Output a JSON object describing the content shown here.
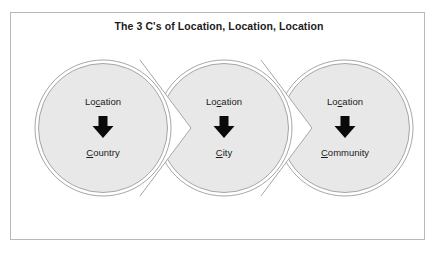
{
  "frame": {
    "border_color": "#b9b9b9",
    "background": "#ffffff"
  },
  "title": "The 3 C's of Location, Location, Location",
  "diagram": {
    "type": "chevron-process",
    "fill_color": "#e8e8e8",
    "stroke_color": "#a6a6a6",
    "arrow_color": "#0a0a0a",
    "nodes": [
      {
        "id": "country",
        "top_label_before": "Lo",
        "top_label_underlined": "c",
        "top_label_after": "ation",
        "top_label_full": "Location",
        "arrow_glyph": "down-arrow",
        "bottom_label_underlined": "C",
        "bottom_label_after": "ountry",
        "bottom_label_full": "Country",
        "cx": 103,
        "cy": 128,
        "r": 68
      },
      {
        "id": "city",
        "top_label_before": "Lo",
        "top_label_underlined": "c",
        "top_label_after": "ation",
        "top_label_full": "Location",
        "arrow_glyph": "down-arrow",
        "bottom_label_underlined": "C",
        "bottom_label_after": "ity",
        "bottom_label_full": "City",
        "cx": 224,
        "cy": 128,
        "r": 68
      },
      {
        "id": "community",
        "top_label_before": "Lo",
        "top_label_underlined": "c",
        "top_label_after": "ation",
        "top_label_full": "Location",
        "arrow_glyph": "down-arrow",
        "bottom_label_underlined": "C",
        "bottom_label_after": "ommunity",
        "bottom_label_full": "Community",
        "cx": 345,
        "cy": 128,
        "r": 68
      }
    ],
    "connectors": [
      {
        "id": "connector-1-2",
        "shape": "chevron-notch",
        "direction": "right"
      },
      {
        "id": "connector-2-3",
        "shape": "chevron-notch",
        "direction": "right"
      }
    ]
  }
}
